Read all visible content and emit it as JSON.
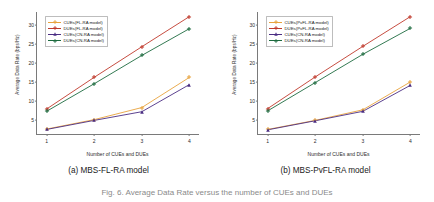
{
  "figure": {
    "caption": "Fig. 6.  Average Data Rate versus the number of CUEs and DUEs",
    "panels": [
      {
        "id": "a",
        "caption": "(a) MBS-FL-RA model",
        "chart_index": 0
      },
      {
        "id": "b",
        "caption": "(b) MBS-PvFL-RA model",
        "chart_index": 1
      }
    ]
  },
  "chart_data": [
    {
      "type": "line",
      "title": "(a) MBS-FL-RA model",
      "xlabel": "Number of CUEs and DUEs",
      "ylabel": "Average Data Rate (bps/Hz)",
      "x": [
        1,
        2,
        3,
        4
      ],
      "xlim": [
        0.8,
        4.2
      ],
      "ylim": [
        1.2,
        33.5
      ],
      "xticks": [
        "1",
        "2",
        "3",
        "4"
      ],
      "yticks": [
        "5",
        "10",
        "15",
        "20",
        "25",
        "30"
      ],
      "grid": false,
      "legend_position": "upper left",
      "series": [
        {
          "name": "CUEs(FL-RA model)",
          "values": [
            2.5,
            5.0,
            8.2,
            16.2
          ],
          "color": "#e8a33d",
          "marker": "plus"
        },
        {
          "name": "DUEs(FL-RA model)",
          "values": [
            7.8,
            16.2,
            24.3,
            32.3
          ],
          "color": "#c0392b",
          "marker": "plus"
        },
        {
          "name": "CUEs(CN-RA model)",
          "values": [
            2.4,
            4.8,
            7.1,
            14.3
          ],
          "color": "#4b2e83",
          "marker": "triangle"
        },
        {
          "name": "DUEs(CN-RA model)",
          "values": [
            7.2,
            14.5,
            22.0,
            29.1
          ],
          "color": "#1d6b3f",
          "marker": "plus"
        }
      ]
    },
    {
      "type": "line",
      "title": "(b) MBS-PvFL-RA model",
      "xlabel": "Number of CUEs and DUEs",
      "ylabel": "Average Data Rate (bps/Hz)",
      "x": [
        1,
        2,
        3,
        4
      ],
      "xlim": [
        0.8,
        4.2
      ],
      "ylim": [
        1.2,
        33.5
      ],
      "xticks": [
        "1",
        "2",
        "3",
        "4"
      ],
      "yticks": [
        "5",
        "10",
        "15",
        "20",
        "25",
        "30"
      ],
      "grid": false,
      "legend_position": "upper left",
      "series": [
        {
          "name": "CUEs(PvFL-RA model)",
          "values": [
            2.4,
            4.8,
            7.6,
            15.0
          ],
          "color": "#e8a33d",
          "marker": "plus"
        },
        {
          "name": "DUEs(PvFL-RA model)",
          "values": [
            7.9,
            16.3,
            24.4,
            32.3
          ],
          "color": "#c0392b",
          "marker": "plus"
        },
        {
          "name": "CUEs(CN-RA model)",
          "values": [
            2.3,
            4.7,
            7.2,
            14.1
          ],
          "color": "#4b2e83",
          "marker": "triangle"
        },
        {
          "name": "DUEs(CN-RA model)",
          "values": [
            7.3,
            14.8,
            22.3,
            29.2
          ],
          "color": "#1d6b3f",
          "marker": "plus"
        }
      ]
    }
  ]
}
